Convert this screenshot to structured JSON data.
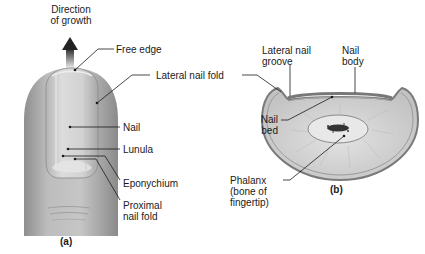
{
  "panel_a": {
    "caption": "(a)",
    "direction_label_line1": "Direction",
    "direction_label_line2": "of growth",
    "labels": {
      "free_edge": "Free edge",
      "lateral_nail_fold": "Lateral nail fold",
      "nail": "Nail",
      "lunula": "Lunula",
      "eponychium": "Eponychium",
      "proximal_nail_fold_line1": "Proximal",
      "proximal_nail_fold_line2": "nail fold"
    }
  },
  "panel_b": {
    "caption": "(b)",
    "labels": {
      "lateral_nail_groove_line1": "Lateral nail",
      "lateral_nail_groove_line2": "groove",
      "nail_body_line1": "Nail",
      "nail_body_line2": "body",
      "nail_bed_line1": "Nail",
      "nail_bed_line2": "bed",
      "phalanx_line1": "Phalanx",
      "phalanx_line2": "(bone of",
      "phalanx_line3": "fingertip)"
    }
  },
  "colors": {
    "skin": "#b9b9b9",
    "nail": "#d6d6d6",
    "tissue": "#cfcfcf",
    "line": "#1a1a1a"
  }
}
